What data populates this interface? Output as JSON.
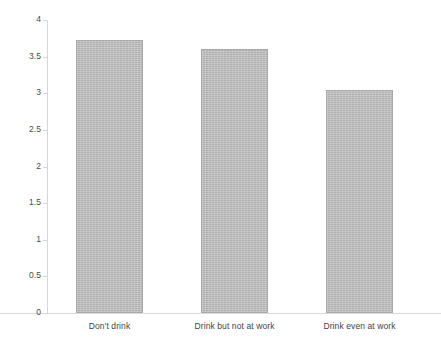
{
  "chart_data": {
    "type": "bar",
    "title": "",
    "subtitle": "",
    "xlabel": "",
    "ylabel": "",
    "categories": [
      "Don't drink",
      "Drink but not at work",
      "Drink even at work"
    ],
    "values": [
      3.73,
      3.6,
      3.04
    ],
    "series": [
      {
        "name": "",
        "values": [
          3.73,
          3.6,
          3.04
        ]
      }
    ],
    "ylim": [
      0,
      4
    ],
    "xlim": [
      0,
      3
    ],
    "yticks": [
      0,
      0.5,
      1,
      1.5,
      2,
      2.5,
      3,
      3.5,
      4
    ],
    "ytick_labels": [
      "0",
      "0.5",
      "1",
      "1.5",
      "2",
      "2.5",
      "3",
      "3.5",
      "4"
    ],
    "grid": false,
    "legend": false,
    "legend_position": "none",
    "annotations": [],
    "colors": {
      "bar_fill": "#c0c0c0",
      "bar_border": "#a9a9a9",
      "axis_line": "#d6d6d6",
      "tick_label": "#4a4a4a",
      "category_label": "#3f3f3f",
      "background": "#ffffff"
    }
  }
}
